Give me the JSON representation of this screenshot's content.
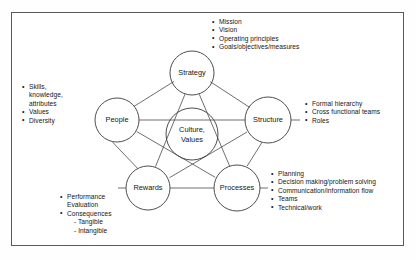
{
  "diagram": {
    "center_node": {
      "name": "center-node",
      "lines": [
        "Culture,",
        "Values"
      ]
    },
    "nodes": [
      {
        "id": "strategy",
        "label": "Strategy"
      },
      {
        "id": "people",
        "label": "People"
      },
      {
        "id": "structure",
        "label": "Structure"
      },
      {
        "id": "rewards",
        "label": "Rewards"
      },
      {
        "id": "processes",
        "label": "Processes"
      }
    ],
    "annotations": {
      "strategy": {
        "items": [
          "Mission",
          "Vision",
          "Operating principles",
          "Goals/objectives/measures"
        ]
      },
      "people": {
        "items": [
          "Skills,",
          "Values",
          "Diversity"
        ],
        "continuations": [
          "knowledge,",
          "attributes"
        ]
      },
      "structure": {
        "items": [
          "Formal hierarchy",
          "Cross functional teams",
          "Roles"
        ]
      },
      "processes": {
        "items": [
          "Planning",
          "Decision making/problem solving",
          "Communication/information flow",
          "Teams",
          "Technical/work"
        ]
      },
      "rewards": {
        "items": [
          "Performance",
          "Consequences"
        ],
        "continuations": [
          "Evaluation"
        ],
        "sub_items": [
          "- Tangible",
          "- Intangible"
        ]
      }
    },
    "colors": {
      "frame_border": "#5a5a5a",
      "line": "#4a4a4a",
      "text": "#151515",
      "background": "#ffffff"
    }
  }
}
